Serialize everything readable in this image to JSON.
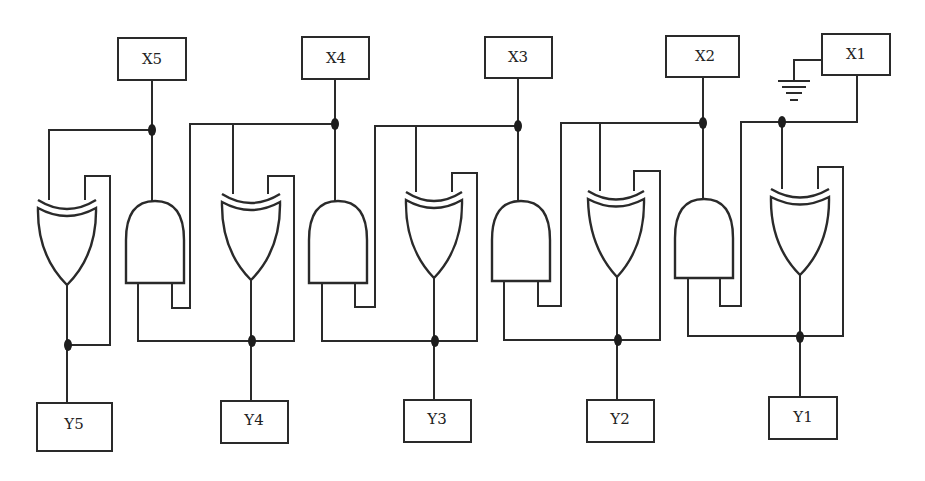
{
  "diagram": {
    "type": "logic-circuit",
    "inputs": [
      {
        "id": "x5",
        "label": "X5"
      },
      {
        "id": "x4",
        "label": "X4"
      },
      {
        "id": "x3",
        "label": "X3"
      },
      {
        "id": "x2",
        "label": "X2"
      },
      {
        "id": "x1",
        "label": "X1"
      }
    ],
    "outputs": [
      {
        "id": "y5",
        "label": "Y5"
      },
      {
        "id": "y4",
        "label": "Y4"
      },
      {
        "id": "y3",
        "label": "Y3"
      },
      {
        "id": "y2",
        "label": "Y2"
      },
      {
        "id": "y1",
        "label": "Y1"
      }
    ],
    "gates": {
      "xor_count": 5,
      "and_count": 4
    },
    "ground": {
      "attached_to": "X1",
      "icon": "ground-icon"
    },
    "colors": {
      "line": "#2a2a2a",
      "background": "#ffffff"
    }
  }
}
